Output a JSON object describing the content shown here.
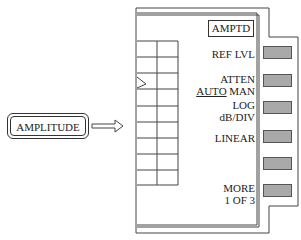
{
  "diagram": {
    "front_panel_key": {
      "label": "AMPLITUDE"
    },
    "arrow": {
      "icon": "hollow-right-arrow"
    },
    "menu": {
      "title": "AMPTD",
      "softkeys": [
        {
          "line1": "REF LVL",
          "line2": ""
        },
        {
          "line1": "ATTEN",
          "line2_underlined": "AUTO",
          "line2_rest": " MAN"
        },
        {
          "line1": "LOG",
          "line2": "dB/DIV"
        },
        {
          "line1": "LINEAR",
          "line2": ""
        },
        {
          "line1": "",
          "line2": ""
        },
        {
          "line1": "MORE",
          "line2": "1 OF 3"
        }
      ]
    },
    "colors": {
      "softkey_fill": "#a9a9a9",
      "line": "#333333"
    }
  }
}
